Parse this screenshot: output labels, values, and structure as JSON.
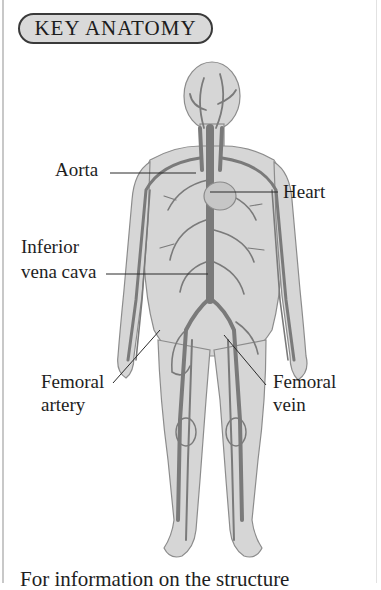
{
  "header": {
    "title": "KEY ANATOMY"
  },
  "figure": {
    "labels": {
      "aorta": "Aorta",
      "heart": "Heart",
      "ivc_line1": "Inferior",
      "ivc_line2": "vena cava",
      "fem_artery_line1": "Femoral",
      "fem_artery_line2": "artery",
      "fem_vein_line1": "Femoral",
      "fem_vein_line2": "vein"
    },
    "colors": {
      "body_fill": "#d4d4d4",
      "body_outline": "#8a8a8a",
      "vessel": "#7a7a7a",
      "leader_line": "#2a2a2a"
    }
  },
  "footer": {
    "text": "For information on the structure"
  }
}
